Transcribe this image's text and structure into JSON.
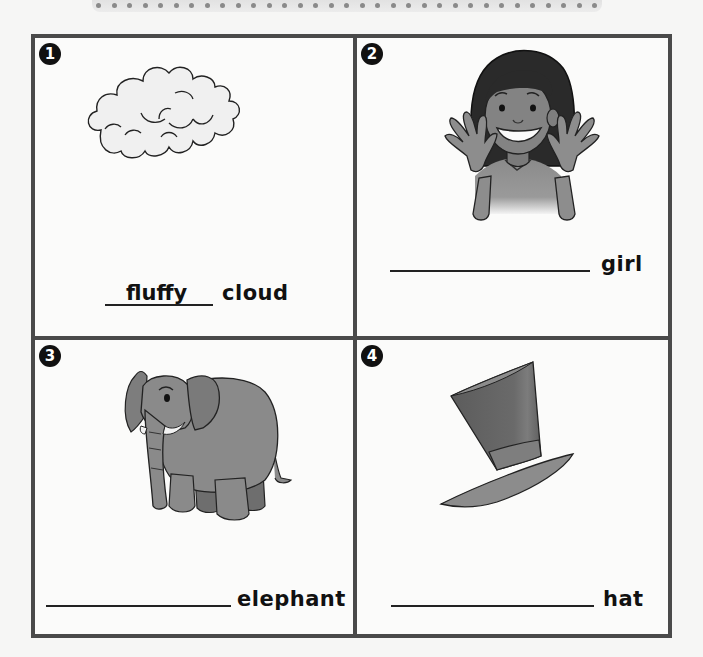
{
  "worksheet": {
    "instructions_visible": false,
    "panels": [
      {
        "number": "1",
        "illustration": "cloud-icon",
        "answer": "fluffy",
        "noun": "cloud"
      },
      {
        "number": "2",
        "illustration": "girl-waving-icon",
        "answer": "",
        "noun": "girl"
      },
      {
        "number": "3",
        "illustration": "elephant-icon",
        "answer": "",
        "noun": "elephant"
      },
      {
        "number": "4",
        "illustration": "top-hat-icon",
        "answer": "",
        "noun": "hat"
      }
    ]
  },
  "colors": {
    "border": "#4a4a4a",
    "badge": "#111111",
    "text": "#111111",
    "page_background": "#f6f6f5"
  }
}
